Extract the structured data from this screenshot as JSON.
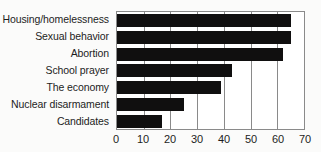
{
  "chart_data": {
    "type": "bar",
    "orientation": "horizontal",
    "title": "",
    "subtitle": "",
    "xlabel": "",
    "ylabel": "",
    "xlim": [
      0,
      70
    ],
    "xticks": [
      0,
      10,
      20,
      30,
      40,
      50,
      60,
      70
    ],
    "xtick_labels": [
      "0",
      "10",
      "20",
      "30",
      "40",
      "50",
      "60",
      "70"
    ],
    "grid": true,
    "grid_axis": "x",
    "legend": false,
    "legend_position": "none",
    "bar_color": "#100f0f",
    "plot_border_color": "#8a8a8a",
    "background_color": "#fbfbfa",
    "plot_background_color": "#ffffff",
    "categories": [
      "Housing/homelessness",
      "Sexual behavior",
      "Abortion",
      "School prayer",
      "The economy",
      "Nuclear disarmament",
      "Candidates"
    ],
    "values": [
      65,
      65,
      62,
      43,
      39,
      25,
      17
    ]
  }
}
